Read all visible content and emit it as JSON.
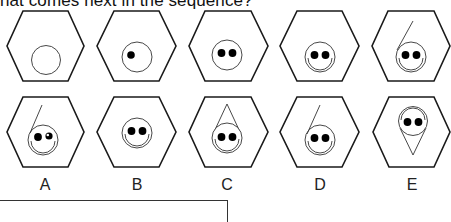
{
  "question": {
    "text": "hat comes next in the sequence?"
  },
  "sequence": {
    "items": [
      {
        "index": 1,
        "description": "empty circle"
      },
      {
        "index": 2,
        "description": "circle with one eye"
      },
      {
        "index": 3,
        "description": "circle with two eyes"
      },
      {
        "index": 4,
        "description": "two eyes with double-ring smile"
      },
      {
        "index": 5,
        "description": "smiley with line going up"
      }
    ]
  },
  "options": [
    {
      "label": "A",
      "description": "smiley with line, one eye highlighted"
    },
    {
      "label": "B",
      "description": "smiley with double-ring smile"
    },
    {
      "label": "C",
      "description": "smiley with cone on top"
    },
    {
      "label": "D",
      "description": "smiley with line going up"
    },
    {
      "label": "E",
      "description": "inverted smiley with cone below"
    }
  ],
  "answer_box": {
    "value": ""
  },
  "colors": {
    "stroke": "#1a1a1a",
    "background": "#ffffff"
  }
}
